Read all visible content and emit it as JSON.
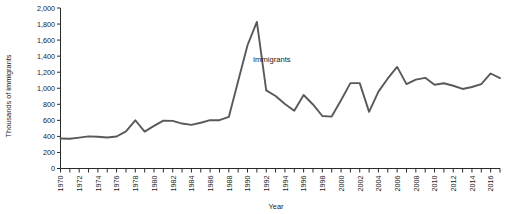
{
  "chart_data": {
    "type": "line",
    "title": "",
    "xlabel": "Year",
    "ylabel": "Thousands of immigrants",
    "xlim": [
      1970,
      2017
    ],
    "ylim": [
      0,
      2000
    ],
    "grid": false,
    "legend": "inline-annotation",
    "series_label": "Immigrants",
    "y_ticks": [
      0,
      200,
      400,
      600,
      800,
      1000,
      1200,
      1400,
      1600,
      1800,
      2000
    ],
    "y_tick_labels": [
      "0",
      "200",
      "400",
      "600",
      "800",
      "1,000",
      "1,200",
      "1,400",
      "1,600",
      "1,800",
      "2,000"
    ],
    "x_ticks": [
      1970,
      1971,
      1972,
      1973,
      1974,
      1975,
      1976,
      1977,
      1978,
      1979,
      1980,
      1981,
      1982,
      1983,
      1984,
      1985,
      1986,
      1987,
      1988,
      1989,
      1990,
      1991,
      1992,
      1993,
      1994,
      1995,
      1996,
      1997,
      1998,
      1999,
      2000,
      2001,
      2002,
      2003,
      2004,
      2005,
      2006,
      2007,
      2008,
      2009,
      2010,
      2011,
      2012,
      2013,
      2014,
      2015,
      2016,
      2017
    ],
    "x_tick_labels": [
      "1970",
      "1972",
      "1974",
      "1976",
      "1978",
      "1980",
      "1982",
      "1984",
      "1986",
      "1988",
      "1990",
      "1992",
      "1994",
      "1996",
      "1998",
      "2000",
      "2002",
      "2004",
      "2006",
      "2008",
      "2010",
      "2012",
      "2014",
      "2016"
    ],
    "x_label_step": 2,
    "line_color": "#595959",
    "axis_color": "#2b2b2b",
    "x": [
      1970,
      1971,
      1972,
      1973,
      1974,
      1975,
      1976,
      1977,
      1978,
      1979,
      1980,
      1981,
      1982,
      1983,
      1984,
      1985,
      1986,
      1987,
      1988,
      1989,
      1990,
      1991,
      1992,
      1993,
      1994,
      1995,
      1996,
      1997,
      1998,
      1999,
      2000,
      2001,
      2002,
      2003,
      2004,
      2005,
      2006,
      2007,
      2008,
      2009,
      2010,
      2011,
      2012,
      2013,
      2014,
      2015,
      2016,
      2017
    ],
    "values": [
      373,
      370,
      385,
      400,
      395,
      386,
      399,
      462,
      601,
      460,
      531,
      597,
      594,
      560,
      544,
      570,
      602,
      602,
      643,
      1091,
      1536,
      1827,
      974,
      904,
      804,
      720,
      916,
      798,
      654,
      647,
      850,
      1064,
      1064,
      706,
      958,
      1122,
      1266,
      1052,
      1107,
      1130,
      1043,
      1062,
      1031,
      991,
      1016,
      1051,
      1184,
      1127
    ]
  },
  "annotations": {
    "series_label": "Immigrants"
  }
}
